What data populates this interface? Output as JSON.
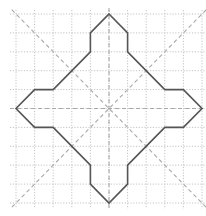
{
  "diagram": {
    "type": "grid-figure",
    "grid": {
      "columns": 10,
      "rows": 10,
      "origin_px": [
        16,
        14
      ],
      "cell_w_px": 18.6,
      "cell_h_px": 18.9,
      "line_color": "#c4c4c4",
      "line_style": "dotted"
    },
    "symmetry_axes": {
      "color": "#a8a8a8",
      "style": "dashed",
      "lines": [
        {
          "name": "vertical-axis",
          "from": [
            5,
            0
          ],
          "to": [
            5,
            10
          ]
        },
        {
          "name": "horizontal-axis",
          "from": [
            0,
            5
          ],
          "to": [
            10,
            5
          ]
        },
        {
          "name": "diagonal-main",
          "from": [
            0,
            0
          ],
          "to": [
            10,
            10
          ]
        },
        {
          "name": "diagonal-anti",
          "from": [
            10,
            0
          ],
          "to": [
            0,
            10
          ]
        }
      ]
    },
    "shape": {
      "stroke": "#555555",
      "stroke_width": 1.6,
      "vertices": [
        [
          5,
          0
        ],
        [
          6,
          1
        ],
        [
          6,
          2
        ],
        [
          8,
          4
        ],
        [
          9,
          4
        ],
        [
          10,
          5
        ],
        [
          9,
          6
        ],
        [
          8,
          6
        ],
        [
          6,
          8
        ],
        [
          6,
          9
        ],
        [
          5,
          10
        ],
        [
          4,
          9
        ],
        [
          4,
          8
        ],
        [
          2,
          6
        ],
        [
          1,
          6
        ],
        [
          0,
          5
        ],
        [
          1,
          4
        ],
        [
          2,
          4
        ],
        [
          4,
          2
        ],
        [
          4,
          1
        ]
      ]
    }
  }
}
